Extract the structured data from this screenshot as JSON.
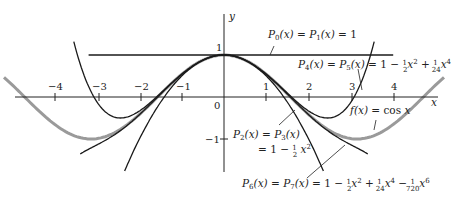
{
  "chart_data": {
    "type": "line",
    "title": "",
    "xlabel": "x",
    "ylabel": "y",
    "xlim": [
      -5.2,
      5.2
    ],
    "ylim": [
      -1.6,
      1.3
    ],
    "grid": false,
    "x_ticks": [
      "-4",
      "-3",
      "-2",
      "-1",
      "1",
      "2",
      "3",
      "4"
    ],
    "y_ticks": [
      "1",
      "-1"
    ],
    "origin_label": "0",
    "series": [
      {
        "name": "f(x) = cos x",
        "color": "#9a9a9a",
        "expr": "cos(x)",
        "x_range": [
          -5.2,
          5.2
        ]
      },
      {
        "name": "P0(x) = P1(x) = 1",
        "color": "#1a1a1a",
        "expr": "1",
        "x_range": [
          -3.2,
          4.0
        ]
      },
      {
        "name": "P2(x) = P3(x) = 1 - (1/2)x^2",
        "color": "#1a1a1a",
        "expr": "1 - x^2/2",
        "x_range": [
          -2.35,
          2.35
        ]
      },
      {
        "name": "P4(x) = P5(x) = 1 - (1/2)x^2 + (1/24)x^4",
        "color": "#1a1a1a",
        "expr": "1 - x^2/2 + x^4/24",
        "x_range": [
          -3.55,
          3.55
        ]
      },
      {
        "name": "P6(x) = P7(x) = 1 - (1/2)x^2 + (1/24)x^4 - (1/720)x^6",
        "color": "#1a1a1a",
        "expr": "1 - x^2/2 + x^4/24 - x^6/720",
        "x_range": [
          -3.4,
          3.4
        ]
      }
    ],
    "annotations": [
      {
        "text": "P0(x) = P1(x) = 1",
        "target": "P0"
      },
      {
        "text": "P4(x) = P5(x) = 1 − ½x² + 1/24 x⁴",
        "target": "P4"
      },
      {
        "text": "f(x) = cos x",
        "target": "cos"
      },
      {
        "text": "P2(x) = P3(x) = 1 − ½x²",
        "target": "P2"
      },
      {
        "text": "P6(x) = P7(x) = 1 − ½x² + 1/24 x⁴ − 1/720 x⁶",
        "target": "P6"
      }
    ]
  },
  "labels": {
    "x_axis": "x",
    "y_axis": "y",
    "origin": "0",
    "y_one": "1",
    "y_minus_one": "−1",
    "xt_m4": "−4",
    "xt_m3": "−3",
    "xt_m2": "−2",
    "xt_m1": "−1",
    "xt_1": "1",
    "xt_2": "2",
    "xt_3": "3",
    "xt_4": "4"
  }
}
